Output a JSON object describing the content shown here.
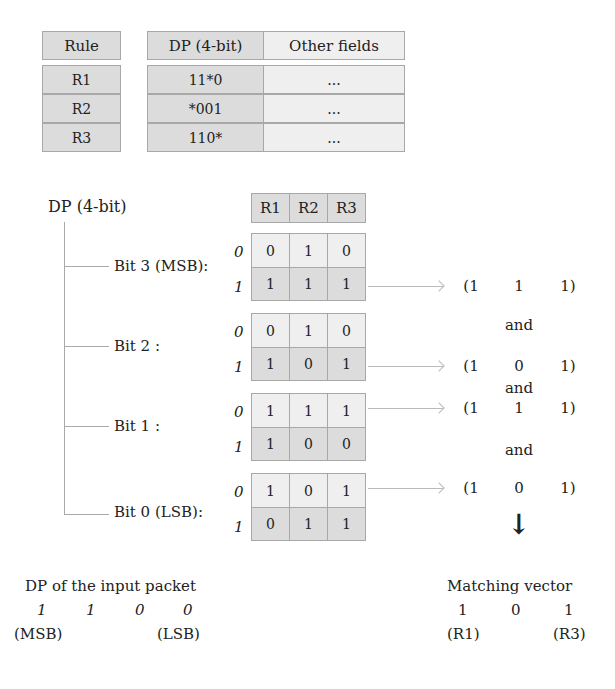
{
  "rule_table": {
    "headers": [
      "Rule",
      "DP (4-bit)",
      "Other fields"
    ],
    "rows": [
      {
        "rule": "R1",
        "dp": "11*0",
        "other": "..."
      },
      {
        "rule": "R2",
        "dp": "*001",
        "other": "..."
      },
      {
        "rule": "R3",
        "dp": "110*",
        "other": "..."
      }
    ]
  },
  "bit_vectors": {
    "root_label": "DP (4-bit)",
    "columns": [
      "R1",
      "R2",
      "R3"
    ],
    "row_labels": [
      "0",
      "1"
    ],
    "bits": [
      {
        "label": "Bit 3 (MSB):",
        "row0": [
          "0",
          "1",
          "0"
        ],
        "row1": [
          "1",
          "1",
          "1"
        ]
      },
      {
        "label": "Bit 2 :",
        "row0": [
          "0",
          "1",
          "0"
        ],
        "row1": [
          "1",
          "0",
          "1"
        ]
      },
      {
        "label": "Bit 1 :",
        "row0": [
          "1",
          "1",
          "1"
        ],
        "row1": [
          "1",
          "0",
          "0"
        ]
      },
      {
        "label": "Bit 0 (LSB):",
        "row0": [
          "1",
          "0",
          "1"
        ],
        "row1": [
          "0",
          "1",
          "1"
        ]
      }
    ]
  },
  "selected_vectors": [
    {
      "open": "(1",
      "mid": "1",
      "close": "1)"
    },
    {
      "open": "(1",
      "mid": "0",
      "close": "1)"
    },
    {
      "open": "(1",
      "mid": "1",
      "close": "1)"
    },
    {
      "open": "(1",
      "mid": "0",
      "close": "1)"
    }
  ],
  "and_label": "and",
  "down_arrow": "↓",
  "input_packet": {
    "title": "DP of the input packet",
    "bits": [
      "1",
      "1",
      "0",
      "0"
    ],
    "msb_label": "(MSB)",
    "lsb_label": "(LSB)"
  },
  "matching_vector": {
    "title": "Matching vector",
    "values": [
      "1",
      "0",
      "1"
    ],
    "left_label": "(R1)",
    "right_label": "(R3)"
  }
}
